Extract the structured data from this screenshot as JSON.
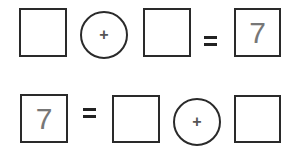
{
  "equations": [
    {
      "layout": "a + b = c",
      "operand_a": "",
      "operator": "+",
      "operand_b": "",
      "equals": "=",
      "result": "7"
    },
    {
      "layout": "c = a + b",
      "result": "7",
      "equals": "=",
      "operand_a": "",
      "operator": "+",
      "operand_b": ""
    }
  ],
  "colors": {
    "stroke": "#2a2a2a",
    "number": "#777777"
  }
}
